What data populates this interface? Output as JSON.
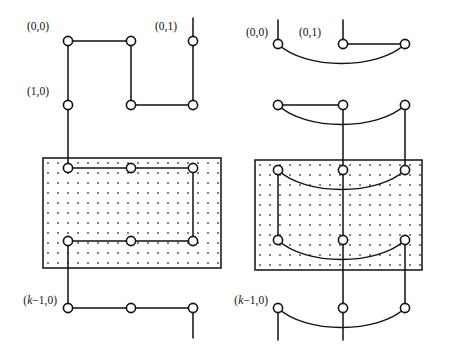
{
  "figure": {
    "name": "two-grid-graph-layouts",
    "background": "#ffffff",
    "ink_color": "#111111",
    "width": 452,
    "height": 356
  },
  "labels": {
    "origin": "(0,0)",
    "second_column": "(0,1)",
    "second_row": "(1,0)",
    "last_row_prefix": "(",
    "last_row_k": "k",
    "last_row_suffix": "−1,0)"
  },
  "panels": [
    {
      "id": "left",
      "name": "rectilinear-layout",
      "style": "orthogonal",
      "columns_x": [
        68,
        131,
        193
      ],
      "rows_y": [
        41,
        105,
        168,
        241,
        308
      ],
      "shaded_box": {
        "x": 43,
        "y": 158,
        "width": 178,
        "height": 110
      },
      "labels_shown": [
        "(0,0)",
        "(0,1)",
        "(1,0)",
        "(k−1,0)"
      ],
      "node_count": 13
    },
    {
      "id": "right",
      "name": "curved-arc-layout",
      "style": "curved",
      "columns_x": [
        278,
        343,
        405
      ],
      "rows_y": [
        44,
        105,
        170,
        240,
        308
      ],
      "shaded_box": {
        "x": 255,
        "y": 160,
        "width": 167,
        "height": 110
      },
      "labels_shown": [
        "(0,0)",
        "(0,1)",
        "(k−1,0)"
      ],
      "node_count": 12
    }
  ],
  "stipple": {
    "spacing": 10,
    "dot_size": 1.6,
    "color": "#3a3a3a"
  },
  "node_style": {
    "radius": 4.6,
    "fill": "#ffffff",
    "stroke": "#111111"
  }
}
